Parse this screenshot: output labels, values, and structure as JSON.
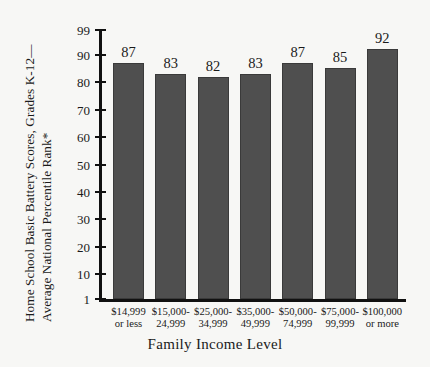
{
  "chart_data": {
    "type": "bar",
    "title": "",
    "xlabel": "Family Income Level",
    "ylabel_line1": "Home School Basic Battery Scores, Grades K-12—",
    "ylabel_line2": "Average National Percentile Rank*",
    "categories": [
      "$14,999\nor less",
      "$15,000-\n24,999",
      "$25,000-\n34,999",
      "$35,000-\n49,999",
      "$50,000-\n74,999",
      "$75,000-\n99,999",
      "$100,000\nor more"
    ],
    "category_lines": [
      [
        "$14,999",
        "or less"
      ],
      [
        "$15,000-",
        "24,999"
      ],
      [
        "$25,000-",
        "34,999"
      ],
      [
        "$35,000-",
        "49,999"
      ],
      [
        "$50,000-",
        "74,999"
      ],
      [
        "$75,000-",
        "99,999"
      ],
      [
        "$100,000",
        "or more"
      ]
    ],
    "values": [
      87,
      83,
      82,
      83,
      87,
      85,
      92
    ],
    "value_labels": [
      "87",
      "83",
      "82",
      "83",
      "87",
      "85",
      "92"
    ],
    "ylim": [
      1,
      99
    ],
    "yticks": [
      1,
      10,
      20,
      30,
      40,
      50,
      60,
      70,
      80,
      90,
      99
    ],
    "ytick_labels": [
      "1",
      "10",
      "20",
      "30",
      "40",
      "50",
      "60",
      "70",
      "80",
      "90",
      "99"
    ],
    "grid": false,
    "legend": null,
    "bar_color": "#4f4f4f",
    "bar_edge_color": "#3a3a3a",
    "axis_color": "#111111",
    "background_color": "#f7f7f5"
  }
}
